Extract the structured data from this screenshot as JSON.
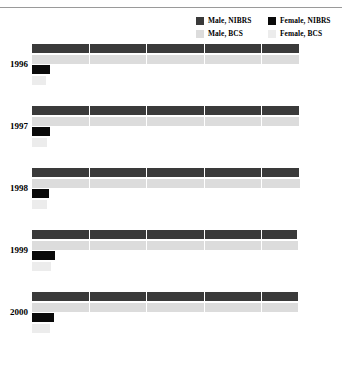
{
  "chart_data": {
    "type": "bar",
    "orientation": "horizontal",
    "title": "",
    "subtitle": "",
    "xlabel": "",
    "ylabel": "",
    "xlim": [
      0,
      100
    ],
    "xticks": [
      0,
      20,
      40,
      60,
      80,
      100
    ],
    "xticklabels": [
      "0",
      "20",
      "40",
      "60",
      "80",
      "100"
    ],
    "categories": [
      "1996",
      "1997",
      "1998",
      "1999",
      "2000"
    ],
    "grid": "vertical-white-gridlines-over-bars",
    "legend_position": "top-right",
    "series": [
      {
        "name": "Male, NIBRS",
        "color": "#3a3a3a",
        "values": [
          93.2,
          93.4,
          93.5,
          92.8,
          92.9
        ]
      },
      {
        "name": "Male, BCS",
        "color": "#dcdcdc",
        "values": [
          93.3,
          93.5,
          93.6,
          93.0,
          93.1
        ]
      },
      {
        "name": "Female, NIBRS",
        "color": "#0a0a0a",
        "values": [
          6.3,
          6.2,
          6.1,
          7.9,
          7.6
        ]
      },
      {
        "name": "Female, BCS",
        "color": "#ececec",
        "values": [
          5.0,
          5.2,
          5.3,
          6.6,
          6.4
        ]
      }
    ]
  },
  "legend": {
    "entries": [
      {
        "label": "Male, NIBRS",
        "color": "#3a3a3a"
      },
      {
        "label": "Female, NIBRS",
        "color": "#0a0a0a"
      },
      {
        "label": "Male, BCS",
        "color": "#dcdcdc"
      },
      {
        "label": "Female, BCS",
        "color": "#ececec"
      }
    ]
  }
}
